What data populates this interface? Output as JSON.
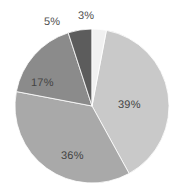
{
  "chart_data": {
    "type": "pie",
    "title": "",
    "subtitle": "",
    "xlabel": "",
    "ylabel": "",
    "grid": false,
    "legend": "none",
    "label_format": "percent",
    "start_angle_deg": 0,
    "direction": "clockwise",
    "center": {
      "cx": 92,
      "cy": 106,
      "r": 77
    },
    "categories": [
      "39%",
      "36%",
      "17%",
      "5%",
      "3%"
    ],
    "values": [
      39,
      36,
      17,
      5,
      3
    ],
    "slices": [
      {
        "label": "39%",
        "value": 39,
        "color": "#c9c9c9",
        "label_position": "inside",
        "start_angle_deg": 10.8,
        "end_angle_deg": 151.2
      },
      {
        "label": "36%",
        "value": 36,
        "color": "#a9a9a9",
        "label_position": "inside",
        "start_angle_deg": 151.2,
        "end_angle_deg": 280.8
      },
      {
        "label": "17%",
        "value": 17,
        "color": "#8b8b8b",
        "label_position": "inside",
        "start_angle_deg": 280.8,
        "end_angle_deg": 342.0
      },
      {
        "label": "5%",
        "value": 5,
        "color": "#5c5c5c",
        "label_position": "outside",
        "start_angle_deg": 342.0,
        "end_angle_deg": 360.0
      },
      {
        "label": "3%",
        "value": 3,
        "color": "#f1f1f1",
        "label_position": "outside",
        "start_angle_deg": 0.0,
        "end_angle_deg": 10.8
      }
    ],
    "background_color": "#ffffff",
    "label_text_color": "#4a4a4a"
  }
}
